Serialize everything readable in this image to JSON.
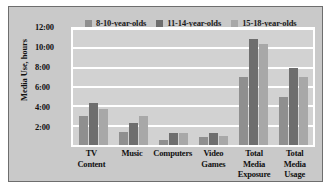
{
  "chart_data": {
    "type": "bar",
    "title": "",
    "xlabel": "",
    "ylabel": "Media Use, hours",
    "categories": [
      "TV Content",
      "Music",
      "Computers",
      "Video Games",
      "Total Media Exposure",
      "Total Media Usage"
    ],
    "category_lines": [
      [
        "TV Content"
      ],
      [
        "Music"
      ],
      [
        "Computers"
      ],
      [
        "Video",
        "Games"
      ],
      [
        "Total Media",
        "Exposure"
      ],
      [
        "Total",
        "Media Usage"
      ]
    ],
    "series": [
      {
        "name": "8-10-year-olds",
        "color": "#8f8f8f",
        "values": [
          3.0,
          1.3,
          0.5,
          0.8,
          7.0,
          5.0
        ]
      },
      {
        "name": "11-14-year-olds",
        "color": "#6e6e6e",
        "values": [
          4.3,
          2.3,
          1.2,
          1.2,
          11.0,
          8.0
        ]
      },
      {
        "name": "15-18-year-olds",
        "color": "#a8a8a8",
        "values": [
          3.7,
          3.0,
          1.2,
          0.9,
          10.5,
          7.0
        ]
      }
    ],
    "ylim": [
      0,
      12
    ],
    "y_ticks": [
      2,
      4,
      6,
      8,
      10,
      12
    ],
    "y_tick_labels": [
      "2:00",
      "4:00",
      "6:00",
      "8:00",
      "10:00",
      "12:00"
    ],
    "grid": true,
    "legend_position": "top"
  },
  "colors": {
    "figure_background": "#c9c9c9",
    "plot_background": "#d2d2d2",
    "gridline": "#ffffff",
    "frame_border": "#6e6e6e",
    "text": "#111111"
  }
}
